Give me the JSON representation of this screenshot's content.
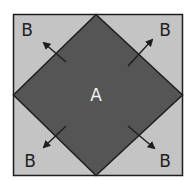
{
  "diagram": {
    "inner_label": "A",
    "corner_labels": [
      "B",
      "B",
      "B",
      "B"
    ],
    "colors": {
      "outer_fill": "#c4c4c4",
      "inner_fill": "#555555",
      "stroke": "#1e1e1e",
      "inner_text": "#f2f2f2",
      "outer_text": "#222222",
      "arrow": "#1e1e1e"
    }
  }
}
